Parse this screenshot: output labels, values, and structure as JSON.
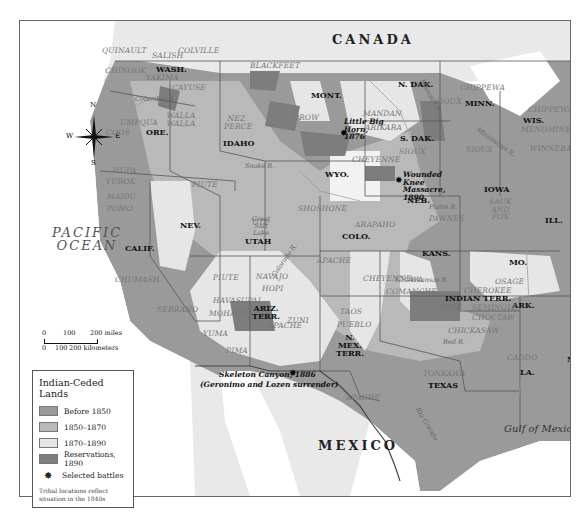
{
  "map": {
    "countries": {
      "canada": "CANADA",
      "mexico": "MEXICO"
    },
    "water": {
      "pacific": "PACIFIC OCEAN",
      "gulf": "Gulf of Mexico"
    },
    "compass": {
      "n": "N",
      "s": "S",
      "e": "E",
      "w": "W"
    },
    "states": {
      "wash": "WASH.",
      "ore": "ORE.",
      "idaho": "IDAHO",
      "mont": "MONT.",
      "wyo": "WYO.",
      "ndak": "N. DAK.",
      "sdak": "S. DAK.",
      "minn": "MINN.",
      "wis": "WIS.",
      "iowa": "IOWA",
      "neb": "NEB.",
      "ill": "ILL.",
      "nev": "NEV.",
      "calif": "CALIF.",
      "utah": "UTAH",
      "colo": "COLO.",
      "kans": "KANS.",
      "mo": "MO.",
      "ariz": "ARIZ. TERR.",
      "nmex": "N. MEX. TERR.",
      "indian": "INDIAN TERR.",
      "ark": "ARK.",
      "texas": "TEXAS",
      "la": "LA.",
      "miss": "MISS."
    },
    "tribes": {
      "quinault": "QUINAULT",
      "salish": "SALISH",
      "colville": "COLVILLE",
      "chinook": "CHINOOK",
      "yakima": "YAKIMA",
      "cayuse": "CAYUSE",
      "walla": "WALLA WALLA",
      "umpqua": "UMPQUA",
      "coos": "COOS",
      "nezperce": "NEZ PERCE",
      "blackfeet": "BLACKFEET",
      "crow": "CROW",
      "mandan": "MANDAN",
      "arikara": "ARIKARA",
      "sioux1": "SIOUX",
      "sioux2": "SIOUX",
      "sioux3": "SIOUX",
      "chippewa1": "CHIPPEWA",
      "chippewa2": "CHIPPEWA",
      "menominee": "MENOMINEE",
      "winnebago": "WINNEBAGO",
      "saukfox": "SAUK AND FOX",
      "pawnee": "PAWNEE",
      "cheyenne1": "CHEYENNE",
      "cheyenne2": "CHEYENNE",
      "shoshone": "SHOSHONE",
      "arapaho": "ARAPAHO",
      "hupa": "HUPA",
      "yurok": "YUROK",
      "maidu": "MAIDU",
      "pomo": "POMO",
      "chumash": "CHUMASH",
      "serrano": "SERRANO",
      "piute1": "PIUTE",
      "piute2": "PIUTE",
      "ute": "UTE",
      "apache1": "APACHE",
      "apache2": "APACHE",
      "apache3": "APACHE",
      "navajo": "NAVAJO",
      "hopi": "HOPI",
      "havasupai": "HAVASUPAI",
      "mohave": "MOHAVE",
      "yuma": "YUMA",
      "pima": "PIMA",
      "zuni": "ZUNI",
      "taos": "TAOS",
      "pueblo": "PUEBLO",
      "kiowa": "KIOWA",
      "comanche": "COMANCHE",
      "osage": "OSAGE",
      "cherokee": "CHEROKEE",
      "creek": "CREEK",
      "seminole": "SEMINOLE",
      "choctaw": "CHOCTAW",
      "chickasaw": "CHICKASAW",
      "tonkawa": "TONKAWA",
      "caddo": "CADDO"
    },
    "rivers": {
      "columbia": "Columbia R.",
      "snake": "Snake R.",
      "missouri": "Missouri R.",
      "mississippi": "Mississippi R.",
      "platte": "Platte R.",
      "colorado": "Colorado R.",
      "arkansas": "Arkansas R.",
      "red": "Red R.",
      "riogrande": "Rio Grande",
      "greatsalt": "Great Salt Lake"
    },
    "battles": {
      "littlebighorn": "Little Big Horn, 1876",
      "woundedknee": "Wounded Knee Massacre, 1890",
      "skeleton": "Skeleton Canyon, 1886",
      "skeleton_note": "(Geronimo and Lozen surrender)"
    },
    "scale": {
      "miles": [
        "0",
        "100",
        "200 miles"
      ],
      "km": [
        "0",
        "100",
        "200 kilometers"
      ]
    }
  },
  "legend": {
    "title": "Indian-Ceded Lands",
    "items": [
      {
        "label": "Before 1850",
        "color": "#9a9a9a"
      },
      {
        "label": "1850–1870",
        "color": "#b9b9b9"
      },
      {
        "label": "1870–1890",
        "color": "#e6e6e6"
      },
      {
        "label": "Reservations, 1890",
        "color": "#7d7d7d"
      },
      {
        "label": "Selected battles",
        "symbol": "battle-star"
      }
    ],
    "note": "Tribal locations reflect situation in the 1840s"
  },
  "colors": {
    "before1850": "#9a9a9a",
    "y1850_1870": "#b9b9b9",
    "y1870_1890": "#e6e6e6",
    "reservations": "#7d7d7d",
    "foreign": "#e9e9e9",
    "water": "#ffffff"
  }
}
